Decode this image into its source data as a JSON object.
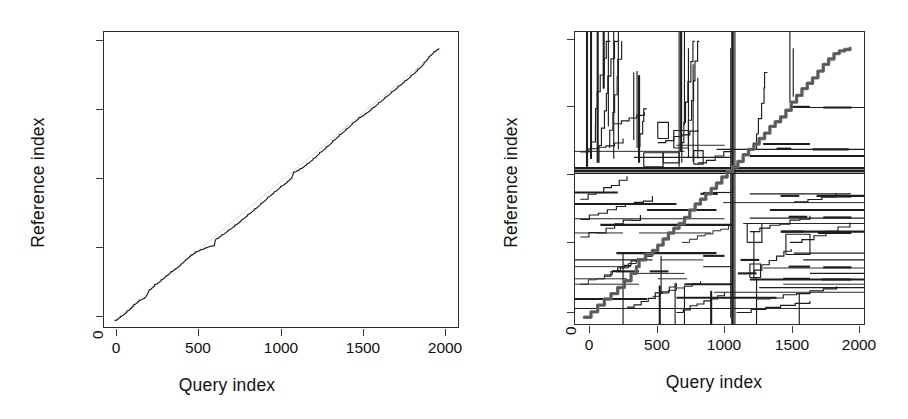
{
  "figure": {
    "kind": "two-panel-dtw-alignment",
    "background": "#ffffff",
    "ink_color": "#1d1d1d",
    "gray_color": "#6d6d6d"
  },
  "panels": [
    {
      "id": "left",
      "axis": {
        "xlabel": "Query index",
        "ylabel": "Reference index",
        "xticks": [
          "0",
          "500",
          "1000",
          "1500",
          "2000"
        ],
        "yticks": [
          "0",
          "500",
          "1000",
          "1500",
          "2000"
        ],
        "xlim": [
          -60,
          2120
        ],
        "ylim": [
          -60,
          2120
        ]
      }
    },
    {
      "id": "right",
      "axis": {
        "xlabel": "Query index",
        "ylabel": "Reference index",
        "xticks": [
          "0",
          "500",
          "1000",
          "1500",
          "2000"
        ],
        "yticks": [
          "0",
          "500",
          "1000",
          "1500",
          "2000"
        ],
        "xlim": [
          -60,
          2120
        ],
        "ylim": [
          -60,
          2120
        ]
      }
    }
  ],
  "chart_data": [
    {
      "type": "line",
      "panel": "left",
      "title": "",
      "xlabel": "Query index",
      "ylabel": "Reference index",
      "xlim": [
        -60,
        2120
      ],
      "ylim": [
        -60,
        2120
      ],
      "xticks": [
        0,
        500,
        1000,
        1500,
        2000
      ],
      "yticks": [
        0,
        500,
        1000,
        1500,
        2000
      ],
      "grid": false,
      "legend": null,
      "series": [
        {
          "name": "alignment path",
          "color": "#1d1d1d",
          "x": [
            5,
            40,
            80,
            120,
            155,
            190,
            205,
            215,
            250,
            290,
            320,
            350,
            380,
            410,
            440,
            470,
            500,
            530,
            560,
            590,
            615,
            620,
            625,
            660,
            700,
            740,
            780,
            820,
            860,
            900,
            940,
            980,
            1020,
            1060,
            1090,
            1100,
            1140,
            1180,
            1220,
            1260,
            1300,
            1340,
            1380,
            1420,
            1460,
            1500,
            1540,
            1580,
            1620,
            1660,
            1700,
            1740,
            1780,
            1820,
            1860,
            1900,
            1930,
            1960,
            1990
          ],
          "y": [
            0,
            30,
            70,
            115,
            150,
            170,
            195,
            225,
            265,
            300,
            330,
            360,
            385,
            415,
            450,
            480,
            505,
            520,
            535,
            548,
            552,
            585,
            600,
            630,
            665,
            700,
            740,
            780,
            820,
            860,
            905,
            945,
            985,
            1020,
            1055,
            1090,
            1115,
            1150,
            1190,
            1235,
            1275,
            1320,
            1365,
            1405,
            1450,
            1490,
            1520,
            1560,
            1600,
            1640,
            1680,
            1720,
            1760,
            1800,
            1845,
            1895,
            1940,
            1975,
            2000
          ]
        }
      ]
    },
    {
      "type": "line",
      "panel": "right",
      "title": "",
      "xlabel": "Query index",
      "ylabel": "Reference index",
      "xlim": [
        -60,
        2120
      ],
      "ylim": [
        -60,
        2120
      ],
      "xticks": [
        0,
        500,
        1000,
        1500,
        2000
      ],
      "yticks": [
        0,
        500,
        1000,
        1500,
        2000
      ],
      "grid": false,
      "legend": null,
      "description": "dense multi-path DTW alignment: thick gray monotone diagonal plus many stepped partial paths, a dominant horizontal band near reference 1090 and a dominant vertical band near query 1120",
      "features": {
        "main_diagonal_gray": {
          "x": [
            10,
            60,
            110,
            160,
            210,
            260,
            310,
            360,
            400,
            420,
            470,
            520,
            560,
            600,
            640,
            680,
            720,
            760,
            800,
            840,
            880,
            920,
            960,
            1000,
            1040,
            1080,
            1120,
            1160,
            1200,
            1240,
            1280,
            1320,
            1360,
            1400,
            1440,
            1480,
            1520,
            1560,
            1600,
            1640,
            1680,
            1720,
            1760,
            1800,
            1840,
            1880,
            1920,
            1960,
            2000
          ],
          "y": [
            5,
            45,
            95,
            140,
            180,
            225,
            275,
            330,
            380,
            430,
            470,
            500,
            540,
            585,
            630,
            665,
            700,
            745,
            800,
            845,
            880,
            920,
            960,
            1000,
            1045,
            1085,
            1120,
            1160,
            1210,
            1250,
            1290,
            1330,
            1370,
            1420,
            1455,
            1490,
            1540,
            1600,
            1650,
            1700,
            1740,
            1780,
            1830,
            1880,
            1920,
            1960,
            1980,
            1990,
            2000
          ]
        },
        "horizontal_band_reference": 1090,
        "vertical_band_query": 1120,
        "secondary_horizontal_bands": [
          70,
          140,
          190,
          225,
          250,
          290,
          330,
          380,
          430,
          480,
          630,
          650,
          690,
          720,
          740,
          800,
          840,
          870,
          910,
          1190,
          1240,
          1270
        ],
        "secondary_vertical_bands": [
          30,
          60,
          110,
          155,
          190,
          230,
          265,
          380,
          405,
          420,
          720,
          735,
          760,
          790,
          825,
          860,
          1110,
          1125,
          1145,
          1550,
          1575
        ]
      }
    }
  ]
}
